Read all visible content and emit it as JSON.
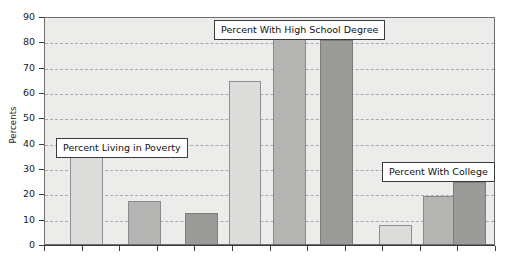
{
  "chart_data": {
    "type": "bar",
    "title": "",
    "xlabel": "",
    "ylabel": "Percents",
    "ylim": [
      0,
      90
    ],
    "ytick_step": 10,
    "yticks": [
      0,
      10,
      20,
      30,
      40,
      50,
      60,
      70,
      80,
      90
    ],
    "ytick_labels": [
      "0",
      "10",
      "20",
      "30",
      "40",
      "50",
      "60",
      "70",
      "80",
      "90"
    ],
    "grid": true,
    "grid_axis": "y",
    "grid_style": "dashed",
    "legend": "none",
    "x_tick_count": 12,
    "x_tick_labels": [],
    "categories": [
      "Percent Living in Poverty",
      "Percent With High School Degree",
      "Percent With College"
    ],
    "series": [
      {
        "name": "light",
        "values": [
          35.5,
          64.5,
          7.5
        ]
      },
      {
        "name": "medium",
        "values": [
          17.0,
          82.5,
          19.0
        ]
      },
      {
        "name": "dark",
        "values": [
          12.3,
          80.5,
          24.5
        ]
      }
    ],
    "bars": [
      {
        "group": 0,
        "shade": "light",
        "value": 35.5,
        "x": 0.055,
        "width": 0.073
      },
      {
        "group": 0,
        "shade": "medium",
        "value": 17.0,
        "x": 0.185,
        "width": 0.073
      },
      {
        "group": 0,
        "shade": "dark",
        "value": 12.3,
        "x": 0.31,
        "width": 0.073
      },
      {
        "group": 1,
        "shade": "light",
        "value": 64.5,
        "x": 0.407,
        "width": 0.073
      },
      {
        "group": 1,
        "shade": "medium",
        "value": 82.5,
        "x": 0.505,
        "width": 0.073
      },
      {
        "group": 1,
        "shade": "dark",
        "value": 80.5,
        "x": 0.61,
        "width": 0.073
      },
      {
        "group": 2,
        "shade": "light",
        "value": 7.5,
        "x": 0.74,
        "width": 0.073
      },
      {
        "group": 2,
        "shade": "medium",
        "value": 19.0,
        "x": 0.838,
        "width": 0.073
      },
      {
        "group": 2,
        "shade": "dark",
        "value": 24.5,
        "x": 0.905,
        "width": 0.073
      }
    ],
    "annotations": [
      {
        "name": "poverty",
        "text": "Percent Living in Poverty",
        "left": 56,
        "top": 138
      },
      {
        "name": "high-school",
        "text": "Percent With High School Degree",
        "left": 214,
        "top": 20
      },
      {
        "name": "college",
        "text": "Percent With College",
        "left": 382,
        "top": 162
      }
    ]
  },
  "colors": {
    "plot_background": "#ececea",
    "plot_border": "#6e6e6e",
    "gridline": "#a9a9a9",
    "axis": "#3a3a3a",
    "bar_light": "#dcdcda",
    "bar_medium": "#b4b4b2",
    "bar_dark": "#9b9b99",
    "bar_outline": "#8a8a8a",
    "annotation_background": "#ffffff",
    "annotation_border": "#3b3b3b",
    "text": "#1a1a1a"
  }
}
